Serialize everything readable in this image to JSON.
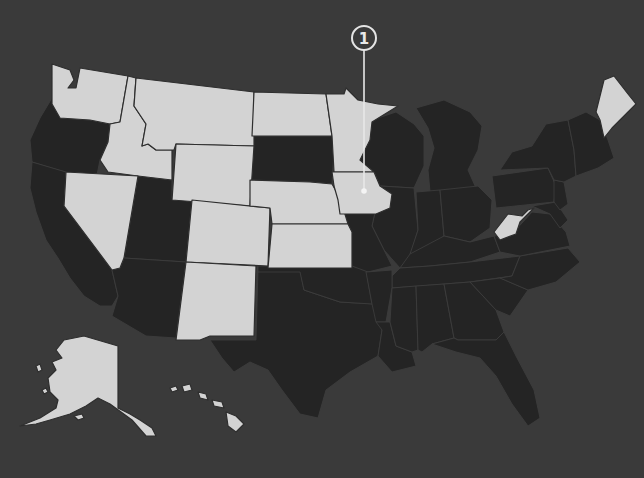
{
  "map": {
    "title": "US States Map",
    "colors": {
      "background": "#3a3a3a",
      "highlighted_state": "#d3d3d3",
      "other_state": "#242424",
      "callout": "#e8e8e8"
    },
    "highlighted_states": [
      "Washington",
      "Idaho",
      "Montana",
      "Wyoming",
      "Nevada",
      "Colorado",
      "New Mexico",
      "North Dakota",
      "Nebraska",
      "Kansas",
      "Minnesota",
      "Iowa",
      "Maine",
      "West Virginia",
      "Alaska",
      "Hawaii"
    ],
    "callouts": [
      {
        "label": "1",
        "target_state": "Iowa"
      }
    ]
  }
}
